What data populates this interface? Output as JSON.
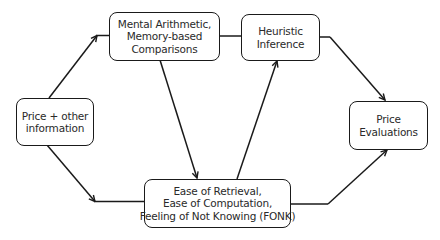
{
  "diagram": {
    "nodes": {
      "price_info": {
        "lines": [
          "Price + other",
          "information"
        ]
      },
      "mental_arithmetic": {
        "lines": [
          "Mental Arithmetic,",
          "Memory-based",
          "Comparisons"
        ]
      },
      "heuristic_inference": {
        "lines": [
          "Heuristic",
          "Inference"
        ]
      },
      "price_evaluations": {
        "lines": [
          "Price",
          "Evaluations"
        ]
      },
      "ease_fonk": {
        "lines": [
          "Ease of Retrieval,",
          "Ease of Computation,",
          "Feeling of Not Knowing (FONK)"
        ]
      }
    },
    "edges": [
      {
        "from": "price_info",
        "to": "mental_arithmetic"
      },
      {
        "from": "price_info",
        "to": "ease_fonk"
      },
      {
        "from": "mental_arithmetic",
        "to": "heuristic_inference"
      },
      {
        "from": "mental_arithmetic",
        "to": "ease_fonk"
      },
      {
        "from": "ease_fonk",
        "to": "heuristic_inference"
      },
      {
        "from": "heuristic_inference",
        "to": "price_evaluations"
      },
      {
        "from": "ease_fonk",
        "to": "price_evaluations"
      }
    ],
    "colors": {
      "stroke": "#1a1a1a",
      "text": "#2a2a2a",
      "background": "#ffffff"
    }
  }
}
